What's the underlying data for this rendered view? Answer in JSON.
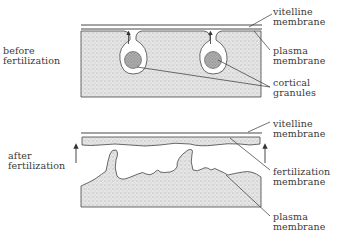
{
  "diagram": {
    "panels": [
      {
        "id": "before",
        "stage_label": [
          "before",
          "fertilization"
        ],
        "labels": {
          "vitelline": [
            "vitelline",
            "membrane"
          ],
          "plasma": [
            "plasma",
            "membrane"
          ],
          "granules": [
            "cortical",
            "granules"
          ]
        }
      },
      {
        "id": "after",
        "stage_label": [
          "after",
          "fertilization"
        ],
        "labels": {
          "vitelline": [
            "vitelline",
            "membrane"
          ],
          "fertilization": [
            "fertilization",
            "membrane"
          ],
          "plasma": [
            "plasma",
            "membrane"
          ]
        }
      }
    ],
    "colors": {
      "line": "#333333",
      "stipple_fill": "#d9d9d9",
      "granule_fill": "#9a9a9a",
      "text": "#3a3a3a",
      "background": "#ffffff"
    }
  }
}
